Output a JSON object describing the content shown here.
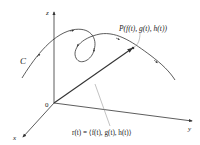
{
  "diagram": {
    "type": "3d-space-curve-with-position-vector",
    "colors": {
      "ink": "#333333",
      "leader": "#999999",
      "background": "#ffffff"
    },
    "axes": {
      "z_label": "z",
      "x_label": "x",
      "y_label": "y",
      "origin_label": "0"
    },
    "curve": {
      "label": "C"
    },
    "point": {
      "label": "P(f(t), g(t), h(t))"
    },
    "vector": {
      "label": "r(t) = ⟨f(t), g(t), h(t)⟩"
    }
  }
}
